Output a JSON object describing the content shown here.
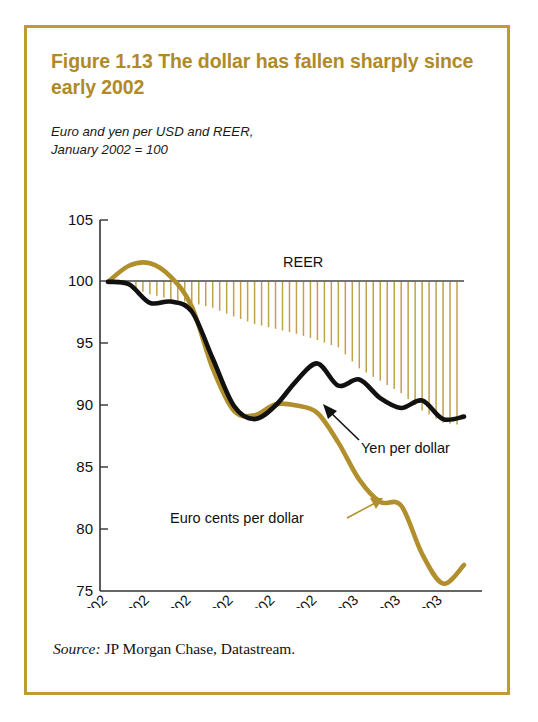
{
  "figure": {
    "title": "Figure 1.13  The dollar has fallen sharply since early 2002",
    "subtitle": "Euro and yen per USD and REER,\nJanuary 2002 = 100",
    "source_label": "Source:",
    "source_text": " JP Morgan Chase, Datastream.",
    "frame_color": "#c09a33",
    "title_color": "#b08a28"
  },
  "chart_data": {
    "type": "line",
    "title": "Figure 1.13  The dollar has fallen sharply since early 2002",
    "subtitle": "Euro and yen per USD and REER, January 2002 = 100",
    "xlabel": "",
    "ylabel": "",
    "ylim": [
      75,
      105
    ],
    "yticks": [
      75,
      80,
      85,
      90,
      95,
      100,
      105
    ],
    "ytick_labels": [
      "75",
      "80",
      "85",
      "90",
      "95",
      "100",
      "105"
    ],
    "grid": false,
    "legend_position": "inline-annotations",
    "x": [
      "Jan. 2002",
      "Feb. 2002",
      "Mar. 2002",
      "Apr. 2002",
      "May 2002",
      "June 2002",
      "July 2002",
      "Aug. 2002",
      "Sept. 2002",
      "Oct. 2002",
      "Nov. 2002",
      "Dec. 2002",
      "Jan. 2003",
      "Feb. 2003",
      "Mar. 2003",
      "Apr. 2003",
      "May 2003",
      "June 2003"
    ],
    "xtick_labels": [
      "Jan. 2002",
      "Mar. 2002",
      "May 2002",
      "July 2002",
      "Sept. 2002",
      "Nov. 2002",
      "Jan. 2003",
      "Mar. 2003",
      "May 2003"
    ],
    "series": [
      {
        "name": "Yen per dollar",
        "color": "#111111",
        "label_text": "Yen per dollar",
        "values": [
          100.0,
          99.8,
          98.3,
          98.4,
          97.6,
          93.8,
          90.0,
          88.9,
          90.0,
          92.0,
          93.4,
          91.6,
          92.1,
          90.6,
          89.8,
          90.4,
          88.9,
          89.1
        ]
      },
      {
        "name": "Euro cents per dollar",
        "color": "#b08f2c",
        "label_text": "Euro cents per dollar",
        "values": [
          100.0,
          101.3,
          101.5,
          100.4,
          98.0,
          93.0,
          89.6,
          89.2,
          90.1,
          90.0,
          89.4,
          87.0,
          84.0,
          82.2,
          81.9,
          78.0,
          75.6,
          77.1
        ]
      },
      {
        "name": "REER",
        "color": "#c0a24a",
        "label_text": "REER",
        "style": "drop-lines-from-100",
        "values": [
          100.0,
          99.6,
          99.0,
          98.6,
          98.3,
          97.9,
          97.2,
          96.6,
          96.2,
          95.8,
          95.3,
          94.7,
          93.0,
          92.0,
          91.0,
          89.6,
          88.6,
          88.4
        ]
      }
    ],
    "annotations": [
      {
        "text": "REER",
        "x_ref": "Sept. 2002",
        "y_ref": 101.8
      },
      {
        "text": "Yen per dollar",
        "x_ref": "Jan. 2003",
        "y_ref": 86.8
      },
      {
        "text": "Euro cents per dollar",
        "x_ref": "Sept. 2002",
        "y_ref": 80.5
      }
    ],
    "reference_line": {
      "value": 100,
      "color": "#444444"
    }
  }
}
